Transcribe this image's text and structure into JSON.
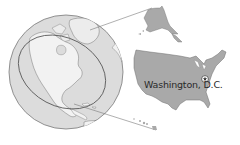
{
  "figure": {
    "type": "locator-map",
    "globe": {
      "projection": "orthographic",
      "centered_on": "North America",
      "highlight": "oval around United States"
    },
    "inset": {
      "regions": [
        "Contiguous United States",
        "Alaska",
        "Hawaii"
      ]
    },
    "marker": {
      "symbol": "star",
      "label": "Washington, D.C."
    },
    "colors": {
      "land": "#a9a9a9",
      "ocean": "#e6e6e6",
      "outline": "#6f6f6f",
      "leader_line": "#7a7a7a",
      "marker_fill": "#ffffff",
      "marker_stroke": "#333333",
      "label_text": "#2a2a2a"
    }
  }
}
